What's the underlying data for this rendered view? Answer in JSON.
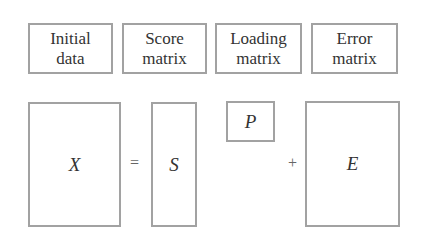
{
  "labels": [
    {
      "line1": "Initial",
      "line2": "data"
    },
    {
      "line1": "Score",
      "line2": "matrix"
    },
    {
      "line1": "Loading",
      "line2": "matrix"
    },
    {
      "line1": "Error",
      "line2": "matrix"
    }
  ],
  "equation": {
    "lhs": "X",
    "equals": "=",
    "score": "S",
    "loading": "P",
    "plus": "+",
    "error": "E"
  },
  "colors": {
    "border": "#a2a2a2",
    "text": "#333333",
    "background": "#ffffff"
  }
}
